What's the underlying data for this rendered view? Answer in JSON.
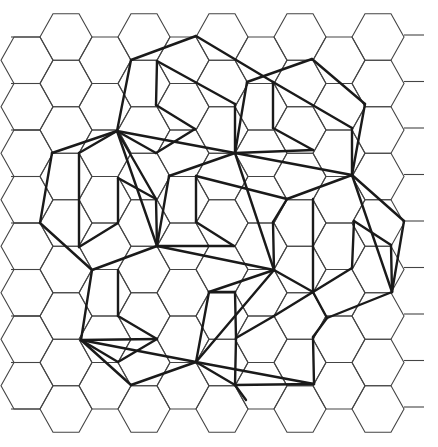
{
  "figure": {
    "background": "#ffffff",
    "grid_color": "#444444",
    "line_color": "#1a1a1a",
    "grid": {
      "hex_radius": 26,
      "col_spacing": 39,
      "row_spacing": 46.5,
      "origin_x": 66,
      "origin_y": 37,
      "cols": 10,
      "rows": 9
    },
    "thick_segments": [
      [
        [
          131,
          60
        ],
        [
          196,
          36
        ]
      ],
      [
        [
          196,
          36
        ],
        [
          273,
          82
        ]
      ],
      [
        [
          131,
          60
        ],
        [
          117,
          131
        ]
      ],
      [
        [
          157,
          61
        ],
        [
          156,
          105
        ]
      ],
      [
        [
          157,
          61
        ],
        [
          235,
          104
        ]
      ],
      [
        [
          156,
          105
        ],
        [
          195,
          129
        ]
      ],
      [
        [
          195,
          129
        ],
        [
          156,
          153
        ]
      ],
      [
        [
          235,
          104
        ],
        [
          235,
          153
        ]
      ],
      [
        [
          156,
          153
        ],
        [
          117,
          131
        ]
      ],
      [
        [
          247,
          82
        ],
        [
          312,
          59
        ]
      ],
      [
        [
          312,
          59
        ],
        [
          365,
          104
        ]
      ],
      [
        [
          247,
          82
        ],
        [
          235,
          153
        ]
      ],
      [
        [
          273,
          82
        ],
        [
          273,
          128
        ]
      ],
      [
        [
          273,
          82
        ],
        [
          352,
          128
        ]
      ],
      [
        [
          273,
          128
        ],
        [
          313,
          150
        ]
      ],
      [
        [
          313,
          150
        ],
        [
          235,
          153
        ]
      ],
      [
        [
          365,
          104
        ],
        [
          352,
          175
        ]
      ],
      [
        [
          352,
          128
        ],
        [
          352,
          175
        ]
      ],
      [
        [
          117,
          131
        ],
        [
          235,
          153
        ]
      ],
      [
        [
          117,
          131
        ],
        [
          52,
          153
        ]
      ],
      [
        [
          117,
          131
        ],
        [
          79,
          153
        ]
      ],
      [
        [
          52,
          153
        ],
        [
          40,
          223
        ]
      ],
      [
        [
          79,
          153
        ],
        [
          79,
          247
        ]
      ],
      [
        [
          117,
          131
        ],
        [
          157,
          246
        ]
      ],
      [
        [
          117,
          131
        ],
        [
          156,
          199
        ]
      ],
      [
        [
          118,
          178
        ],
        [
          118,
          223
        ]
      ],
      [
        [
          118,
          178
        ],
        [
          156,
          199
        ]
      ],
      [
        [
          118,
          223
        ],
        [
          79,
          247
        ]
      ],
      [
        [
          40,
          223
        ],
        [
          92,
          270
        ]
      ],
      [
        [
          92,
          270
        ],
        [
          157,
          246
        ]
      ],
      [
        [
          156,
          199
        ],
        [
          157,
          246
        ]
      ],
      [
        [
          235,
          153
        ],
        [
          169,
          176
        ]
      ],
      [
        [
          235,
          153
        ],
        [
          352,
          175
        ]
      ],
      [
        [
          235,
          153
        ],
        [
          274,
          270
        ]
      ],
      [
        [
          196,
          176
        ],
        [
          196,
          222
        ]
      ],
      [
        [
          196,
          176
        ],
        [
          287,
          199
        ]
      ],
      [
        [
          169,
          176
        ],
        [
          157,
          246
        ]
      ],
      [
        [
          196,
          222
        ],
        [
          234,
          246
        ]
      ],
      [
        [
          234,
          246
        ],
        [
          157,
          246
        ]
      ],
      [
        [
          157,
          246
        ],
        [
          274,
          270
        ]
      ],
      [
        [
          287,
          199
        ],
        [
          273,
          222
        ]
      ],
      [
        [
          352,
          175
        ],
        [
          287,
          199
        ]
      ],
      [
        [
          352,
          175
        ],
        [
          404,
          221
        ]
      ],
      [
        [
          352,
          175
        ],
        [
          392,
          292
        ]
      ],
      [
        [
          313,
          199
        ],
        [
          313,
          292
        ]
      ],
      [
        [
          354,
          221
        ],
        [
          391,
          245
        ]
      ],
      [
        [
          354,
          221
        ],
        [
          352,
          268
        ]
      ],
      [
        [
          391,
          245
        ],
        [
          392,
          292
        ]
      ],
      [
        [
          404,
          221
        ],
        [
          392,
          292
        ]
      ],
      [
        [
          352,
          268
        ],
        [
          313,
          292
        ]
      ],
      [
        [
          392,
          292
        ],
        [
          327,
          318
        ]
      ],
      [
        [
          274,
          270
        ],
        [
          313,
          292
        ]
      ],
      [
        [
          274,
          270
        ],
        [
          209,
          292
        ]
      ],
      [
        [
          274,
          270
        ],
        [
          196,
          362
        ]
      ],
      [
        [
          273,
          222
        ],
        [
          274,
          270
        ]
      ],
      [
        [
          92,
          270
        ],
        [
          81,
          340
        ]
      ],
      [
        [
          118,
          270
        ],
        [
          118,
          316
        ]
      ],
      [
        [
          118,
          316
        ],
        [
          157,
          339
        ]
      ],
      [
        [
          157,
          339
        ],
        [
          118,
          362
        ]
      ],
      [
        [
          81,
          340
        ],
        [
          157,
          339
        ]
      ],
      [
        [
          81,
          340
        ],
        [
          196,
          362
        ]
      ],
      [
        [
          81,
          340
        ],
        [
          131,
          385
        ]
      ],
      [
        [
          81,
          340
        ],
        [
          118,
          362
        ]
      ],
      [
        [
          209,
          292
        ],
        [
          196,
          362
        ]
      ],
      [
        [
          235,
          292
        ],
        [
          236,
          338
        ]
      ],
      [
        [
          236,
          338
        ],
        [
          274,
          316
        ]
      ],
      [
        [
          274,
          316
        ],
        [
          313,
          292
        ]
      ],
      [
        [
          196,
          362
        ],
        [
          131,
          385
        ]
      ],
      [
        [
          196,
          362
        ],
        [
          235,
          385
        ]
      ],
      [
        [
          196,
          362
        ],
        [
          314,
          384
        ]
      ],
      [
        [
          236,
          338
        ],
        [
          235,
          385
        ]
      ],
      [
        [
          313,
          337
        ],
        [
          314,
          384
        ]
      ],
      [
        [
          327,
          318
        ],
        [
          313,
          337
        ]
      ],
      [
        [
          235,
          385
        ],
        [
          314,
          384
        ]
      ],
      [
        [
          313,
          292
        ],
        [
          327,
          318
        ]
      ],
      [
        [
          209,
          292
        ],
        [
          235,
          292
        ]
      ],
      [
        [
          235,
          385
        ],
        [
          246,
          400
        ]
      ]
    ]
  }
}
